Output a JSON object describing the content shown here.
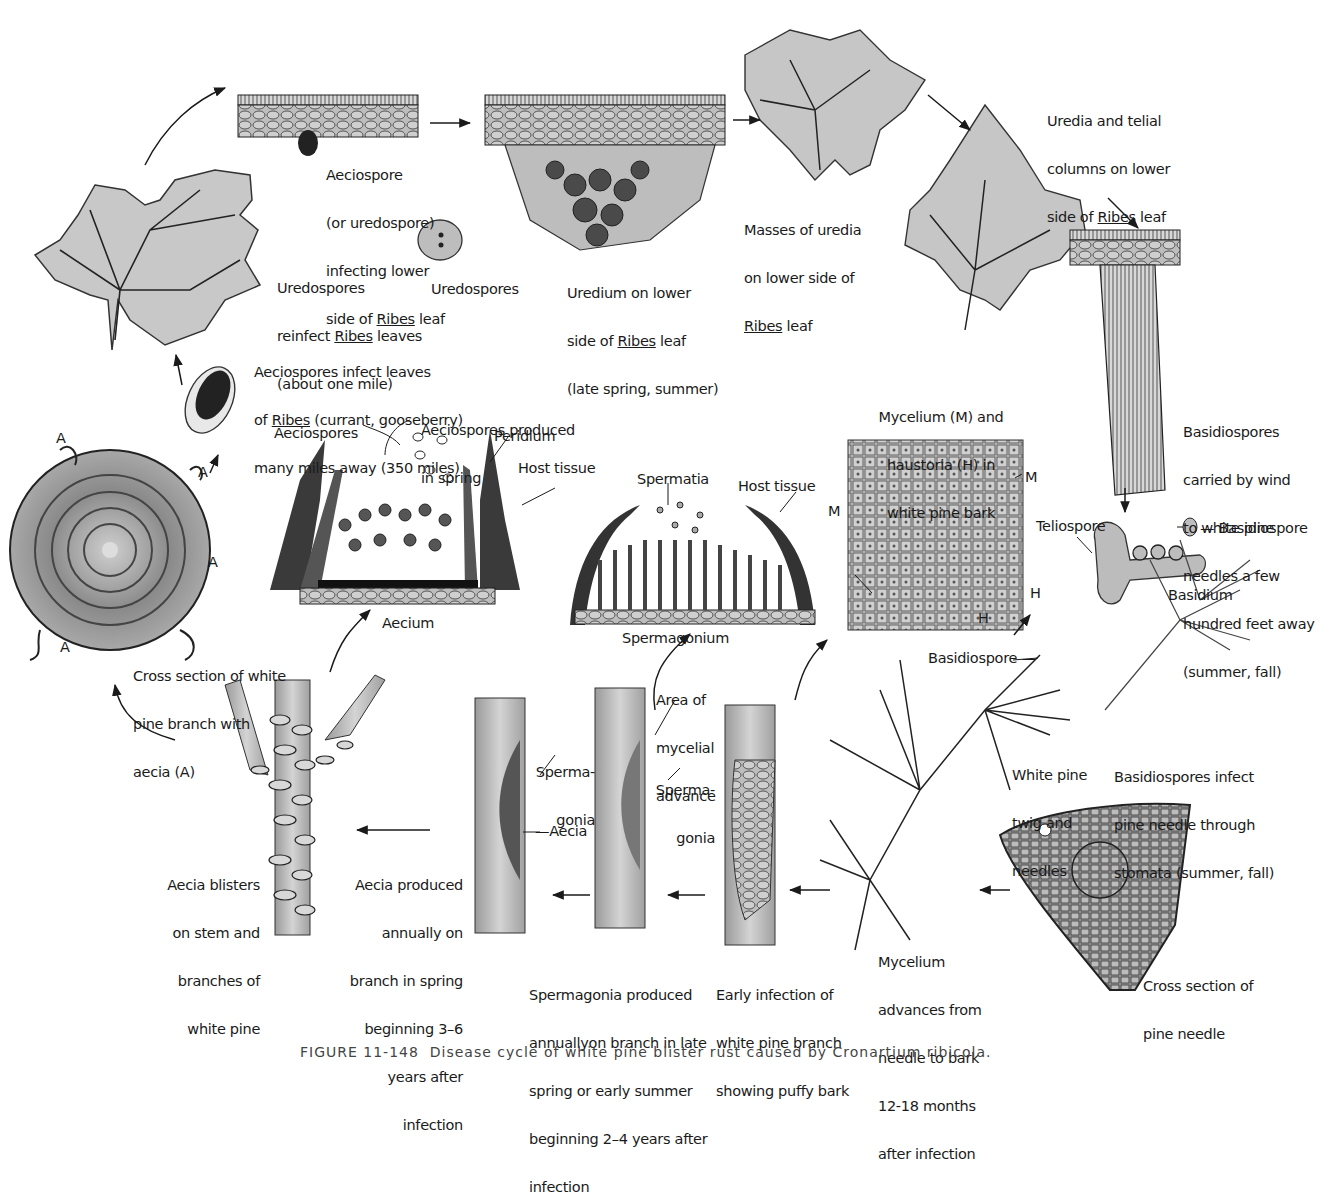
{
  "figure": {
    "caption_partial": "FIGURE 11-148  Disease cycle of white pine blister rust caused by Cronartium ribicola.",
    "colors": {
      "ink": "#1a1a1a",
      "leaf_fill": "#c8c8c8",
      "tissue_fill": "#b5b5b5",
      "dark_fill": "#3a3a3a",
      "background": "#ffffff"
    }
  },
  "labels": {
    "aeciospore_infecting": [
      "Aeciospore",
      "(or uredospore)",
      "infecting lower",
      "side of Ribes leaf"
    ],
    "uredium": [
      "Uredium on lower",
      "side of Ribes leaf",
      "(late spring, summer)"
    ],
    "masses_uredia": [
      "Masses of uredia",
      "on lower side of",
      "Ribes leaf"
    ],
    "uredia_telial": [
      "Uredia and telial",
      "columns on lower",
      "side of Ribes leaf"
    ],
    "uredospores_reinfect": [
      "Uredospores",
      "reinfect Ribes leaves",
      "(about one mile)"
    ],
    "uredospores": "Uredospores",
    "aeciospores_infect": [
      "Aeciospores infect leaves",
      "of Ribes (currant, gooseberry)",
      "many miles away (350 miles)"
    ],
    "aeciospores_produced": [
      "Aeciospores produced",
      "in spring"
    ],
    "aeciospores": "Aeciospores",
    "peridium": "Peridium",
    "host_tissue_1": "Host tissue",
    "aecium": "Aecium",
    "spermatia": "Spermatia",
    "host_tissue_2": "Host tissue",
    "spermagonium": "Spermagonium",
    "mycelium_haustoria": [
      "Mycelium (M) and",
      "haustoria (H) in",
      "white pine bark"
    ],
    "m_label": "M",
    "h_label": "H",
    "basidiospores_carried": [
      "Basidiospores",
      "carried by wind",
      "to white pine",
      "needles a few",
      "hundred feet away",
      "(summer, fall)"
    ],
    "teliospore": "Teliospore",
    "basidiospore_1": "Basidiospore",
    "basidium": "Basidium",
    "basidiospore_2": "Basidiospore",
    "white_pine_twig": [
      "White pine",
      "twig and",
      "needles"
    ],
    "basidiospores_infect": [
      "Basidiospores infect",
      "pine needle through",
      "stomata (summer, fall)"
    ],
    "cross_section_needle": [
      "Cross section of",
      "pine needle"
    ],
    "mycelium_advances": [
      "Mycelium",
      "advances from",
      "needle to bark",
      "12-18 months",
      "after infection"
    ],
    "early_infection": [
      "Early infection of",
      "white pine branch",
      "showing puffy bark"
    ],
    "area_mycelial": [
      "Area of",
      "mycelial",
      "advance"
    ],
    "spermagonia_a": [
      "Sperma-",
      "gonia"
    ],
    "spermagonia_b": [
      "Sperma-",
      "gonia"
    ],
    "aecia": "Aecia",
    "spermagonia_produced": [
      "Spermagonia produced",
      "annuallyon branch in late",
      "spring or early summer",
      "beginning 2–4 years after",
      "infection"
    ],
    "aecia_produced": [
      "Aecia produced",
      "annually on",
      "branch in spring",
      "beginning 3–6",
      "years after",
      "infection"
    ],
    "aecia_blisters": [
      "Aecia blisters",
      "on stem and",
      "branches of",
      "white pine"
    ],
    "cross_section_branch": [
      "Cross section of white",
      "pine branch with",
      "aecia (A)"
    ],
    "a_marker": "A"
  }
}
